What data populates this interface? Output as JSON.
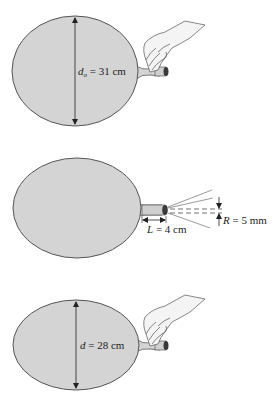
{
  "colors": {
    "balloon_fill": "#d4d4d4",
    "balloon_stroke": "#555555",
    "line": "#333333",
    "nozzle_dark": "#3a3a3a",
    "hand_fill": "#f4f4f4",
    "background": "#ffffff"
  },
  "panels": [
    {
      "id": "initial",
      "label_var": "d",
      "label_sub": "o",
      "label_value": " = 31 cm",
      "label_full": "d_o = 31 cm",
      "has_hand": true
    },
    {
      "id": "deflating",
      "length_var": "L",
      "length_value": " = 4 cm",
      "length_full": "L = 4 cm",
      "radius_var": "R",
      "radius_value": " = 5 mm",
      "radius_full": "R = 5 mm",
      "has_hand": false
    },
    {
      "id": "final",
      "label_var": "d",
      "label_value": " = 28 cm",
      "label_full": "d = 28 cm",
      "has_hand": true
    }
  ],
  "icons": [
    "hand-icon",
    "balloon-icon",
    "nozzle-icon",
    "arrow-icon"
  ]
}
